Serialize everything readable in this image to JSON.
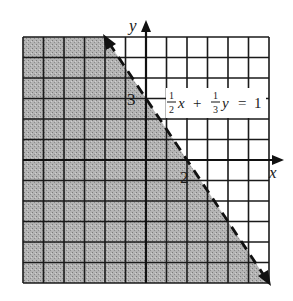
{
  "graph": {
    "type": "linear-inequality",
    "equation": "(1/2)x + (1/3)y = 1",
    "equation_label": {
      "term1_num": "1",
      "term1_den": "2",
      "term1_var": "x",
      "plus": "+",
      "term2_num": "1",
      "term2_den": "3",
      "term2_var": "y",
      "equals": "=",
      "rhs": "1"
    },
    "axis_labels": {
      "x": "x",
      "y": "y"
    },
    "intercept_labels": {
      "x_intercept": "2",
      "y_intercept": "3"
    },
    "grid": {
      "xmin": -6,
      "xmax": 6,
      "ymin": -6,
      "ymax": 6,
      "step": 1
    },
    "boundary": {
      "style": "dashed",
      "points": [
        [
          -2,
          6
        ],
        [
          6,
          -6
        ]
      ],
      "arrows": "both"
    },
    "shaded_region": "below-left of line ((1/2)x + (1/3)y < 1)",
    "colors": {
      "shade": "#a8a8a8",
      "grid": "#1a1a1a",
      "line": "#1a1a1a",
      "background": "#ffffff"
    }
  }
}
